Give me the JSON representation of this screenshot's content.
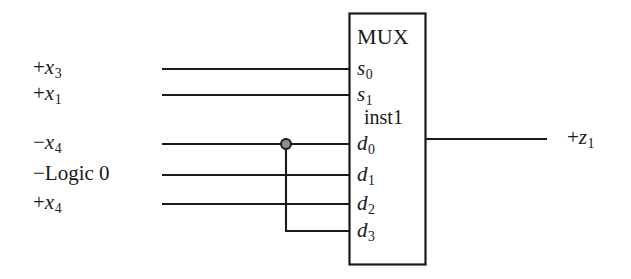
{
  "diagram": {
    "type": "logic-schematic",
    "title_text": "MUX",
    "instance_name": "inst1",
    "block": {
      "label": "MUX",
      "instance": "inst1",
      "x": 349,
      "y": 13,
      "width": 76,
      "height": 252,
      "stroke": "#1a1a1a",
      "fill": "#ffffff"
    },
    "colors": {
      "wire": "#1a1a1a",
      "text": "#1a1a1a",
      "background": "#ffffff",
      "junction_fill": "#8c8c8c",
      "junction_stroke": "#1a1a1a"
    },
    "select_ports": [
      {
        "port": "s",
        "sub": "0",
        "label_sign": "+",
        "label_var": "x",
        "label_sub": "3",
        "wire_y": 69
      },
      {
        "port": "s",
        "sub": "1",
        "label_sign": "+",
        "label_var": "x",
        "label_sub": "1",
        "wire_y": 95
      }
    ],
    "data_ports": [
      {
        "port": "d",
        "sub": "0",
        "label_sign": "−",
        "label_var": "x",
        "label_sub": "4",
        "wire_y": 144
      },
      {
        "port": "d",
        "sub": "1",
        "label_sign": "−",
        "label_word": "Logic 0",
        "label_var": "",
        "label_sub": "",
        "wire_y": 175
      },
      {
        "port": "d",
        "sub": "2",
        "label_sign": "+",
        "label_var": "x",
        "label_sub": "4",
        "wire_y": 204
      },
      {
        "port": "d",
        "sub": "3",
        "label_sign": "",
        "label_var": "",
        "label_sub": "",
        "wire_y": 231
      }
    ],
    "output": {
      "label_sign": "+",
      "label_var": "z",
      "label_sub": "1",
      "wire_y": 139,
      "wire_x_start": 425,
      "wire_x_end": 547
    },
    "junction": {
      "x": 286,
      "y": 144,
      "radius": 5,
      "drop_to_y": 231,
      "note": "-x4 net tapped and routed down to d3"
    },
    "wire_x_start": 162,
    "labels": {
      "s0": "s",
      "s0_sub": "0",
      "s1": "s",
      "s1_sub": "1",
      "d0": "d",
      "d0_sub": "0",
      "d1": "d",
      "d1_sub": "1",
      "d2": "d",
      "d2_sub": "2",
      "d3": "d",
      "d3_sub": "3"
    }
  }
}
